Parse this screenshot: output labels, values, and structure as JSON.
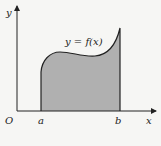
{
  "diagram": {
    "y_axis_label": "y",
    "x_axis_label": "x",
    "origin_label": "O",
    "left_bound_label": "a",
    "right_bound_label": "b",
    "curve_label": "y = f(x)",
    "fill_color": "#b0b0b0",
    "stroke_color": "#222222"
  }
}
